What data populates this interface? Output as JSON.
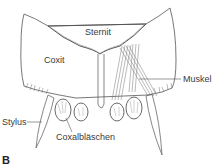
{
  "figure": {
    "panel_label": "B",
    "labels": {
      "sternit": "Sternit",
      "coxit": "Coxit",
      "muskel": "Muskel",
      "stylus": "Stylus",
      "coxalblaeschen": "Coxalbläschen"
    },
    "colors": {
      "line": "#555555",
      "text": "#3a3a3a",
      "background": "#ffffff"
    }
  }
}
